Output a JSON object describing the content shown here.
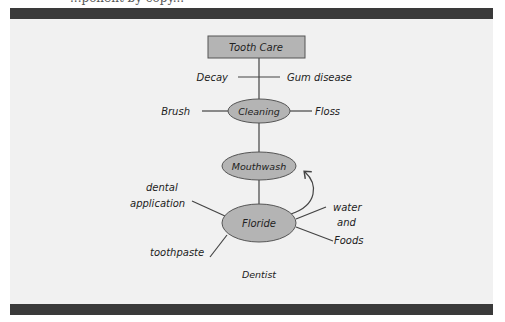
{
  "caption_clipped": "...ponent by copy...",
  "diagram": {
    "root": {
      "label": "Tooth Care"
    },
    "level1_branches": {
      "left": "Decay",
      "right": "Gum disease"
    },
    "cleaning": {
      "label": "Cleaning",
      "left": "Brush",
      "right": "Floss"
    },
    "mouthwash": {
      "label": "Mouthwash"
    },
    "floride": {
      "label": "Floride",
      "left_top_line1": "dental",
      "left_top_line2": "application",
      "left_bottom": "toothpaste",
      "right_line1": "water",
      "right_line2": "and",
      "right_line3": "Foods"
    },
    "footer_label": "Dentist"
  },
  "colors": {
    "panel": "#f1f1f1",
    "bar": "#3a3a3a",
    "node_fill": "#b4b4b4",
    "line": "#444444"
  }
}
